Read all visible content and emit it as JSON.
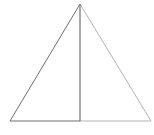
{
  "diagram": {
    "type": "triangle-with-altitude",
    "width": 154,
    "height": 135,
    "background": "#ffffff",
    "points": {
      "apex": {
        "x": 80,
        "y": 4
      },
      "base_left": {
        "x": 10,
        "y": 121
      },
      "base_right": {
        "x": 151,
        "y": 121
      },
      "altitude_foot": {
        "x": 80,
        "y": 121
      }
    },
    "colors": {
      "dark_stroke": "#6e6e6e",
      "light_stroke": "#b4b4b4"
    },
    "labels": []
  }
}
